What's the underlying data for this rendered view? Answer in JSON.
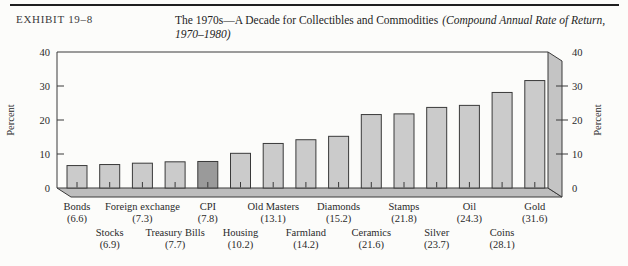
{
  "header": {
    "exhibit_label": "EXHIBIT 19–8",
    "title_main": "The 1970s—A Decade for Collectibles and Commodities",
    "title_italic": "(Compound Annual Rate of Return, 1970–1980)"
  },
  "chart_data": {
    "type": "bar",
    "ylabel_left": "Percent",
    "ylabel_right": "Percent",
    "ylim": [
      0,
      40
    ],
    "yticks": [
      0,
      10,
      20,
      30,
      40
    ],
    "grid": false,
    "legend": "none",
    "categories": [
      "Bonds",
      "Stocks",
      "Foreign exchange",
      "Treasury Bills",
      "CPI",
      "Housing",
      "Old Masters",
      "Farmland",
      "Diamonds",
      "Ceramics",
      "Stamps",
      "Silver",
      "Oil",
      "Coins",
      "Gold"
    ],
    "values": [
      6.6,
      6.9,
      7.3,
      7.7,
      7.8,
      10.2,
      13.1,
      14.2,
      15.2,
      21.6,
      21.8,
      23.7,
      24.3,
      28.1,
      31.6
    ],
    "highlighted_category": "CPI",
    "colors": {
      "bar": "#cbcbcb",
      "bar_highlight": "#9a9a9a",
      "outline": "#3a3a3a",
      "floor": "#bdbdbd",
      "wall": "#c4c4c4",
      "text": "#2a2a2a"
    }
  }
}
